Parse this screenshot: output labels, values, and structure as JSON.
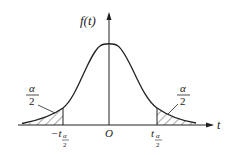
{
  "diagram": {
    "type": "t-distribution two-tailed critical region",
    "y_axis_label": "f(t)",
    "x_axis_label": "t",
    "origin_label": "O",
    "left_tail": {
      "area_label_num": "α",
      "area_label_den": "2",
      "cutoff_prefix": "−t",
      "cutoff_sub_num": "α",
      "cutoff_sub_den": "2"
    },
    "right_tail": {
      "area_label_num": "α",
      "area_label_den": "2",
      "cutoff_prefix": "t",
      "cutoff_sub_num": "α",
      "cutoff_sub_den": "2"
    },
    "colors": {
      "stroke": "#222222",
      "background": "#ffffff"
    }
  }
}
